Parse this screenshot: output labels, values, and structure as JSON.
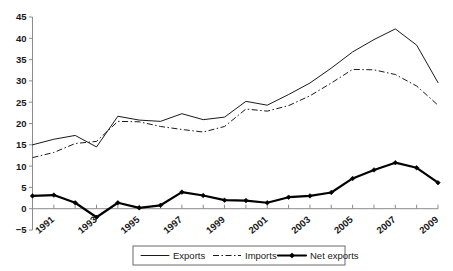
{
  "chart_data": {
    "type": "line",
    "title": "",
    "subtitle": "",
    "xlabel": "",
    "ylabel": "",
    "x": [
      1990,
      1991,
      1992,
      1993,
      1994,
      1995,
      1996,
      1997,
      1998,
      1999,
      2000,
      2001,
      2002,
      2003,
      2004,
      2005,
      2006,
      2007,
      2008,
      2009
    ],
    "tick_labels": [
      "1991",
      "1993",
      "1995",
      "1997",
      "1999",
      "2001",
      "2003",
      "2005",
      "2007",
      "2009"
    ],
    "tick_years": [
      1991,
      1993,
      1995,
      1997,
      1999,
      2001,
      2003,
      2005,
      2007,
      2009
    ],
    "y_ticks": [
      -5,
      0,
      5,
      10,
      15,
      20,
      25,
      30,
      35,
      40,
      45
    ],
    "y_tick_labels": [
      "−5",
      "0",
      "5",
      "10",
      "15",
      "20",
      "25",
      "30",
      "35",
      "40",
      "45"
    ],
    "ylim": [
      -5,
      45
    ],
    "xlim": [
      1990,
      2009
    ],
    "grid": false,
    "legend_position": "bottom",
    "series": [
      {
        "name": "Exports",
        "style": "solid",
        "color": "#1a1a1a",
        "markers": false,
        "values": [
          15.0,
          16.3,
          17.2,
          14.5,
          21.7,
          20.8,
          20.5,
          22.3,
          20.9,
          21.5,
          25.2,
          24.3,
          26.8,
          29.5,
          33.0,
          36.8,
          39.7,
          42.2,
          38.4,
          29.6
        ]
      },
      {
        "name": "Imports",
        "style": "dash-dot",
        "color": "#1a1a1a",
        "markers": false,
        "values": [
          12.0,
          13.2,
          15.3,
          15.8,
          20.5,
          20.4,
          19.3,
          18.6,
          18.0,
          19.3,
          23.4,
          22.9,
          24.2,
          26.5,
          29.5,
          32.7,
          32.6,
          31.5,
          28.8,
          24.3
        ]
      },
      {
        "name": "Net exports",
        "style": "thick-solid",
        "color": "#000000",
        "markers": true,
        "values": [
          3.0,
          3.2,
          1.4,
          -2.0,
          1.4,
          0.2,
          0.8,
          3.9,
          3.1,
          2.0,
          1.9,
          1.4,
          2.7,
          3.0,
          3.8,
          7.1,
          9.1,
          10.8,
          9.6,
          6.1
        ]
      }
    ]
  },
  "legend": {
    "entries": [
      {
        "label": "Exports",
        "style": "solid"
      },
      {
        "label": "Imports",
        "style": "dash-dot"
      },
      {
        "label": "Net exports",
        "style": "thick-solid"
      }
    ]
  }
}
